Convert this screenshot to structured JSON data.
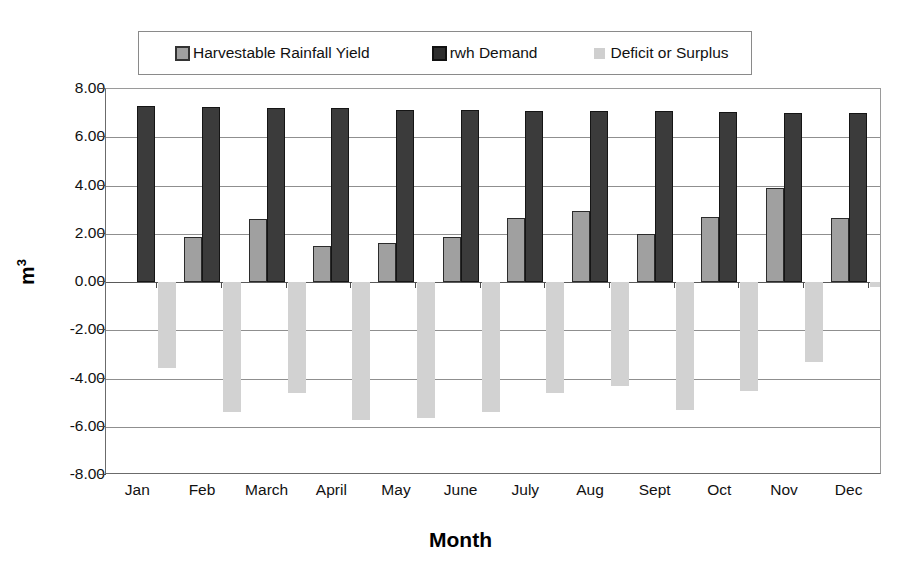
{
  "chart_data": {
    "type": "bar",
    "title": "",
    "xlabel": "Month",
    "ylabel": "m3",
    "ylabel_display": "m",
    "ylabel_superscript": "3",
    "categories": [
      "Jan",
      "Feb",
      "March",
      "April",
      "May",
      "June",
      "July",
      "Aug",
      "Sept",
      "Oct",
      "Nov",
      "Dec"
    ],
    "series": [
      {
        "name": "Harvestable Rainfall Yield",
        "color": "#a0a0a0",
        "border_color": "#2b2b2b",
        "values": [
          0.0,
          1.85,
          2.6,
          1.5,
          1.6,
          1.85,
          2.65,
          2.95,
          2.0,
          2.7,
          3.9,
          2.65
        ]
      },
      {
        "name": "rwh Demand",
        "color": "#3b3b3b",
        "border_color": "#151515",
        "values": [
          7.3,
          7.25,
          7.2,
          7.2,
          7.15,
          7.15,
          7.1,
          7.1,
          7.1,
          7.05,
          7.0,
          7.0
        ]
      },
      {
        "name": "Deficit or Surplus",
        "color": "#d2d2d2",
        "border_color": "none",
        "values": [
          -3.55,
          -5.4,
          -4.6,
          -5.7,
          -5.65,
          -5.4,
          -4.6,
          -4.3,
          -5.3,
          -4.5,
          -3.3,
          -0.2
        ]
      }
    ],
    "ylim": [
      -8.0,
      8.0
    ],
    "ytick_values": [
      8.0,
      6.0,
      4.0,
      2.0,
      0.0,
      -2.0,
      -4.0,
      -6.0,
      -8.0
    ],
    "ytick_labels": [
      "8.00",
      "6.00",
      "4.00",
      "2.00",
      "0.00",
      "-2.00",
      "-4.00",
      "-6.00",
      "-8.00"
    ],
    "grid": true,
    "legend_position": "top"
  },
  "legend": {
    "items": [
      {
        "label": "Harvestable Rainfall Yield"
      },
      {
        "label": "rwh Demand"
      },
      {
        "label": "Deficit or Surplus"
      }
    ]
  }
}
